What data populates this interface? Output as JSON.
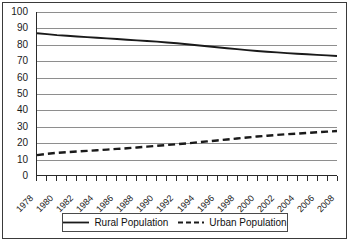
{
  "chart_data": {
    "type": "line",
    "title": "",
    "xlabel": "",
    "ylabel": "",
    "xlim": [
      1978,
      2008
    ],
    "ylim": [
      0,
      100
    ],
    "grid": true,
    "legend_position": "bottom",
    "y_ticks": [
      0,
      10,
      20,
      30,
      40,
      50,
      60,
      70,
      80,
      90,
      100
    ],
    "x_tick_labels": [
      "1978",
      "1980",
      "1982",
      "1984",
      "1986",
      "1988",
      "1990",
      "1992",
      "1994",
      "1996",
      "1998",
      "2000",
      "2002",
      "2004",
      "2006",
      "2008"
    ],
    "x": [
      1978,
      1979,
      1980,
      1981,
      1982,
      1983,
      1984,
      1985,
      1986,
      1987,
      1988,
      1989,
      1990,
      1991,
      1992,
      1993,
      1994,
      1995,
      1996,
      1997,
      1998,
      1999,
      2000,
      2001,
      2002,
      2003,
      2004,
      2005,
      2006,
      2007,
      2008
    ],
    "series": [
      {
        "name": "Rural Population",
        "style": "solid",
        "color": "#1a1a1a",
        "values": [
          87.0,
          86.4,
          85.8,
          85.4,
          85.0,
          84.6,
          84.2,
          83.8,
          83.4,
          83.0,
          82.6,
          82.2,
          81.8,
          81.3,
          80.8,
          80.2,
          79.6,
          79.0,
          78.4,
          77.8,
          77.2,
          76.6,
          76.1,
          75.6,
          75.2,
          74.8,
          74.4,
          74.1,
          73.7,
          73.4,
          73.0
        ]
      },
      {
        "name": "Urban Population",
        "style": "dashed",
        "color": "#1a1a1a",
        "values": [
          12.2,
          13.0,
          13.6,
          14.0,
          14.4,
          14.8,
          15.2,
          15.6,
          16.0,
          16.4,
          16.9,
          17.4,
          17.9,
          18.4,
          18.9,
          19.4,
          20.0,
          20.6,
          21.2,
          21.8,
          22.4,
          23.0,
          23.6,
          24.1,
          24.6,
          25.0,
          25.4,
          25.8,
          26.2,
          26.6,
          27.0
        ]
      }
    ]
  },
  "legend": {
    "items": [
      {
        "label": "Rural Population",
        "style": "solid"
      },
      {
        "label": "Urban Population",
        "style": "dashed"
      }
    ]
  }
}
